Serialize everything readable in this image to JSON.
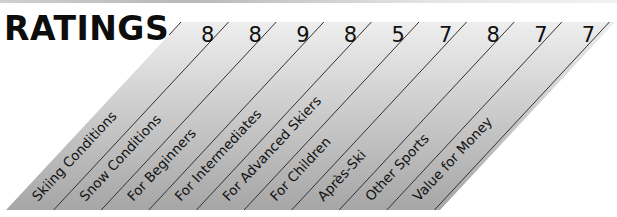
{
  "title": "RATINGS",
  "colors": {
    "panel_top": "#ececec",
    "panel_bottom": "#a8a8a8",
    "divider": "#333333",
    "text": "#111111"
  },
  "ratings": [
    {
      "label": "Skiing Conditions",
      "score": "8"
    },
    {
      "label": "Snow Conditions",
      "score": "8"
    },
    {
      "label": "For Beginners",
      "score": "9"
    },
    {
      "label": "For Intermediates",
      "score": "8"
    },
    {
      "label": "For Advanced Skiers",
      "score": "5"
    },
    {
      "label": "For Children",
      "score": "7"
    },
    {
      "label": "Après-Ski",
      "score": "8"
    },
    {
      "label": "Other Sports",
      "score": "7"
    },
    {
      "label": "Value for Money",
      "score": "7"
    }
  ]
}
